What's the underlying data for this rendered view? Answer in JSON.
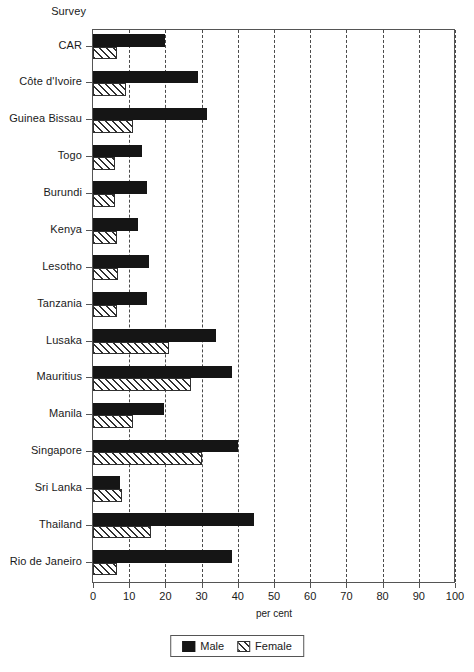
{
  "axis_header": "Survey",
  "chart_data": {
    "type": "bar",
    "orientation": "horizontal",
    "title": "",
    "subtitle": "",
    "xlabel": "per cent",
    "ylabel": "Survey",
    "xlim": [
      0,
      100
    ],
    "xticks": [
      0,
      10,
      20,
      30,
      40,
      50,
      60,
      70,
      80,
      90,
      100
    ],
    "xtick_labels": [
      "0",
      "10",
      "20",
      "30",
      "40",
      "50",
      "60",
      "70",
      "80",
      "90",
      "100"
    ],
    "grid": "vertical-dashed",
    "legend_position": "bottom-center",
    "categories": [
      "CAR",
      "Côte d'Ivoire",
      "Guinea Bissau",
      "Togo",
      "Burundi",
      "Kenya",
      "Lesotho",
      "Tanzania",
      "Lusaka",
      "Mauritius",
      "Manila",
      "Singapore",
      "Sri Lanka",
      "Thailand",
      "Rio de Janeiro"
    ],
    "series": [
      {
        "name": "Male",
        "fill": "solid-black",
        "color": "#151515",
        "values": [
          20,
          29,
          31.5,
          13.5,
          15,
          12.5,
          15.5,
          15,
          34,
          38.5,
          19.5,
          40,
          7.5,
          44.5,
          38.5
        ]
      },
      {
        "name": "Female",
        "fill": "diagonal-hatch",
        "color": "#303030",
        "values": [
          6.5,
          9,
          11,
          6,
          6,
          6.5,
          7,
          6.5,
          21,
          27,
          11,
          30,
          8,
          16,
          6.5
        ]
      }
    ]
  },
  "legend": {
    "entries": [
      {
        "label": "Male"
      },
      {
        "label": "Female"
      }
    ]
  }
}
